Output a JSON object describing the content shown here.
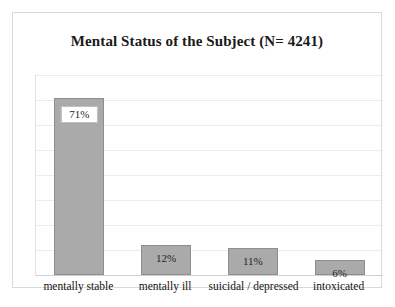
{
  "chart_data": {
    "type": "bar",
    "title": "Mental Status of the Subject (N= 4241)",
    "xlabel": "",
    "ylabel": "",
    "ylim": [
      0,
      80
    ],
    "grid": true,
    "legend": "none",
    "orientation": "vertical",
    "value_suffix": "%",
    "categories": [
      "mentally stable",
      "mentally ill",
      "suicidal / depressed",
      "intoxicated"
    ],
    "values": [
      71,
      12,
      11,
      6
    ],
    "value_labels": [
      "71%",
      "12%",
      "11%",
      "6%"
    ],
    "label_styles": [
      "boxed",
      "plain",
      "plain",
      "plain"
    ],
    "colors": {
      "bar_fill": "#aaaaaa",
      "bar_border": "#8e8e8e",
      "gridline": "#ececec",
      "frame": "#d9d9d9",
      "text": "#1a1a1a",
      "label_box_fill": "#ffffff",
      "label_box_border": "#bfbfbf"
    },
    "gridline_values": [
      80,
      70,
      60,
      50,
      40,
      30,
      20,
      10,
      0
    ]
  }
}
